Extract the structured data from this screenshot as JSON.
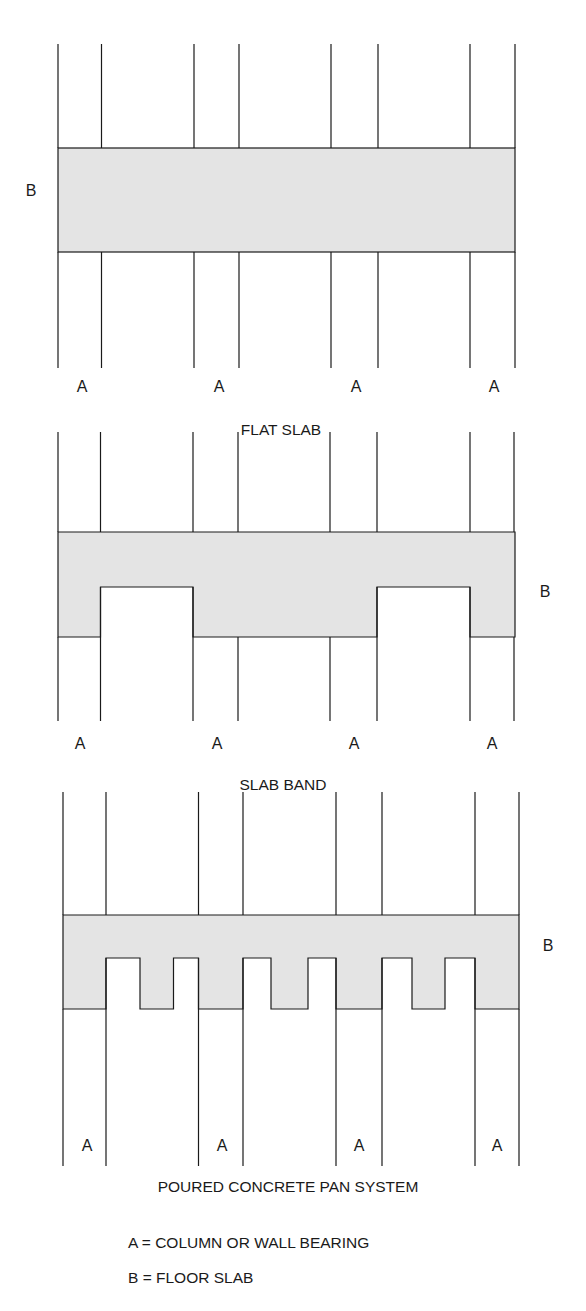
{
  "diagrams": [
    {
      "title": "FLAT SLAB",
      "slab_label": "B",
      "bearing_labels": [
        "A",
        "A",
        "A",
        "A"
      ]
    },
    {
      "title": "SLAB BAND",
      "slab_label": "B",
      "bearing_labels": [
        "A",
        "A",
        "A",
        "A"
      ]
    },
    {
      "title": "POURED CONCRETE PAN SYSTEM",
      "slab_label": "B",
      "bearing_labels": [
        "A",
        "A",
        "A",
        "A"
      ]
    }
  ],
  "legend": [
    "A = COLUMN OR WALL BEARING",
    "B = FLOOR SLAB"
  ],
  "colors": {
    "line": "#1a1a1a",
    "slab_fill": "#e4e4e4",
    "background": "#ffffff"
  }
}
